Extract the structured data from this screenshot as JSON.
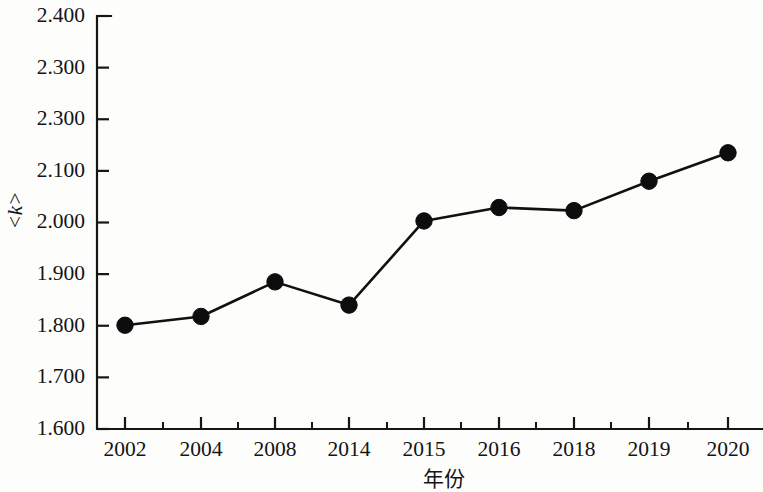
{
  "chart_data": {
    "type": "line",
    "title": "",
    "subtitle": "",
    "xlabel": "年份",
    "ylabel": "<k>",
    "x": [
      "2002",
      "2004",
      "2008",
      "2014",
      "2015",
      "2016",
      "2018",
      "2019",
      "2020"
    ],
    "categories": [
      "2002",
      "2004",
      "2008",
      "2014",
      "2015",
      "2016",
      "2018",
      "2019",
      "2020"
    ],
    "values": [
      1.801,
      1.818,
      1.885,
      1.84,
      2.003,
      2.029,
      2.023,
      2.08,
      2.135
    ],
    "series": [
      {
        "name": "<k>",
        "values": [
          1.801,
          1.818,
          1.885,
          1.84,
          2.003,
          2.029,
          2.023,
          2.08,
          2.135
        ]
      }
    ],
    "ylim": [
      1.6,
      2.4
    ],
    "ytick_values": [
      2.4,
      2.3,
      2.2,
      2.1,
      2.0,
      1.9,
      1.8,
      1.7,
      1.6
    ],
    "ytick_labels": [
      "2.400",
      "2.300",
      "2.300",
      "2.100",
      "2.000",
      "1.900",
      "1.800",
      "1.700",
      "1.600"
    ],
    "xtick_labels": [
      "2002",
      "2004",
      "2008",
      "2014",
      "2015",
      "2016",
      "2018",
      "2019",
      "2020"
    ],
    "grid": false,
    "legend": false,
    "legend_position": "none",
    "marker": "filled-circle",
    "line_color": "#111111",
    "marker_color": "#0d0d0d",
    "axis_color": "#161616",
    "background_color": "#fdfdfc",
    "annotations": [],
    "note": "Second y tick label reads 2.300 as printed (duplicate of the tick above); its true gridline value is 2.200."
  },
  "axes_geometry": {
    "plot_left": 97,
    "plot_right": 762,
    "plot_top": 16,
    "plot_bottom": 429,
    "x_positions": [
      125,
      201,
      275,
      349,
      424,
      499,
      574,
      649,
      728
    ],
    "minor_x_positions": [
      163,
      238,
      312,
      387,
      461,
      536,
      611,
      688
    ]
  }
}
